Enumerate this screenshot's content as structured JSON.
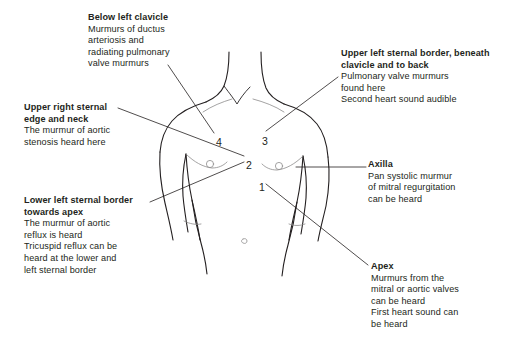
{
  "diagram": {
    "background_color": "#ffffff",
    "line_color": "#231f20",
    "text_color": "#231f20"
  },
  "callouts": [
    {
      "id": "below-left-clavicle",
      "title": "Below left clavicle",
      "body": "Murmurs of ductus\narteriosis and\nradiating pulmonary\nvalve murmurs"
    },
    {
      "id": "upper-left-sternal",
      "title": "Upper left sternal border, beneath\nclavicle and to back",
      "body": "Pulmonary valve murmurs\nfound here\nSecond heart sound audible"
    },
    {
      "id": "upper-right-sternal",
      "title": "Upper right sternal\nedge and neck",
      "body": "The murmur of aortic\nstenosis heard here"
    },
    {
      "id": "axilla",
      "title": "Axilla",
      "body": "Pan systolic murmur\nof mitral regurgitation\ncan be heard"
    },
    {
      "id": "lower-left-sternal",
      "title": "Lower left sternal border\ntowards apex",
      "body": "The murmur of aortic\nreflux is heard\nTricuspid reflux can be\nheard at the lower and\nleft sternal border"
    },
    {
      "id": "apex",
      "title": "Apex",
      "body": "Murmurs from the\nmitral or aortic valves\ncan be heard\nFirst heart sound can\nbe heard"
    }
  ],
  "markers": [
    {
      "label": "1",
      "x": 259,
      "y": 181
    },
    {
      "label": "2",
      "x": 246,
      "y": 159
    },
    {
      "label": "3",
      "x": 262,
      "y": 135
    },
    {
      "label": "4",
      "x": 216,
      "y": 136
    }
  ]
}
